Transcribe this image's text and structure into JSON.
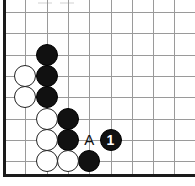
{
  "diagram": {
    "kind": "go-board-corner-diagram",
    "width": 195,
    "height": 186,
    "board": {
      "origin_x": 4,
      "origin_y": 12,
      "spacing": 21.3,
      "cols": 9,
      "rows": 8,
      "grid_color": "#9a9a9a",
      "edge_color": "#1a1a1a",
      "background": "#ffffff",
      "edges": [
        "left",
        "bottom"
      ]
    },
    "stone_size": 22,
    "colors": {
      "black_stone": "#111111",
      "white_stone": "#ffffff",
      "white_stone_border": "#222222",
      "number_text": "#ffffff",
      "label_text": "#111111"
    },
    "stones": [
      {
        "name": "black-stone-c2-r2",
        "color": "black",
        "col": 2,
        "row": 2,
        "label": ""
      },
      {
        "name": "black-stone-c2-r3",
        "color": "black",
        "col": 2,
        "row": 3,
        "label": ""
      },
      {
        "name": "black-stone-c2-r4",
        "color": "black",
        "col": 2,
        "row": 4,
        "label": ""
      },
      {
        "name": "black-stone-c3-r5",
        "color": "black",
        "col": 3,
        "row": 5,
        "label": ""
      },
      {
        "name": "black-stone-c3-r6",
        "color": "black",
        "col": 3,
        "row": 6,
        "label": ""
      },
      {
        "name": "black-stone-c4-r7",
        "color": "black",
        "col": 4,
        "row": 7,
        "label": ""
      },
      {
        "name": "white-stone-c1-r3",
        "color": "white",
        "col": 1,
        "row": 3,
        "label": ""
      },
      {
        "name": "white-stone-c1-r4",
        "color": "white",
        "col": 1,
        "row": 4,
        "label": ""
      },
      {
        "name": "white-stone-c2-r5",
        "color": "white",
        "col": 2,
        "row": 5,
        "label": ""
      },
      {
        "name": "white-stone-c2-r6",
        "color": "white",
        "col": 2,
        "row": 6,
        "label": ""
      },
      {
        "name": "white-stone-c2-r7",
        "color": "white",
        "col": 2,
        "row": 7,
        "label": ""
      },
      {
        "name": "white-stone-c3-r7",
        "color": "white",
        "col": 3,
        "row": 7,
        "label": ""
      },
      {
        "name": "black-move-stone-1",
        "color": "black",
        "col": 5,
        "row": 6,
        "label": "1"
      }
    ],
    "point_labels": [
      {
        "name": "point-label-a",
        "text": "A",
        "col": 4,
        "row": 6
      }
    ]
  }
}
